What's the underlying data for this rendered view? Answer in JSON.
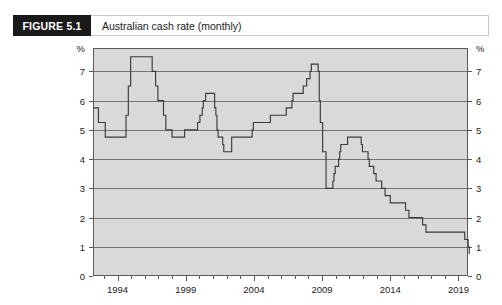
{
  "figure": {
    "number_label": "FIGURE 5.1",
    "title": "Australian cash rate (monthly)"
  },
  "colors": {
    "header_box": "#1a1a1a",
    "header_text": "#ffffff",
    "plot_background": "#d9d9d9",
    "plot_border": "#5a5a5a",
    "gridline": "#6b6b6b",
    "series_line": "#3b3b3b",
    "page_background": "#ffffff"
  },
  "chart_data": {
    "type": "line",
    "title": "Australian cash rate (monthly)",
    "xlabel": "",
    "ylabel": "%",
    "y_unit_label": "%",
    "y_unit_label_right": "%",
    "xlim": [
      1992.2,
      2019.7
    ],
    "ylim": [
      0,
      7.8
    ],
    "yticks": [
      0,
      1,
      2,
      3,
      4,
      5,
      6,
      7
    ],
    "ytick_labels": [
      "0",
      "1",
      "2",
      "3",
      "4",
      "5",
      "6",
      "7"
    ],
    "ytick_labels_right": [
      "0",
      "1",
      "2",
      "3",
      "4",
      "5",
      "6",
      "7"
    ],
    "xticks_major": [
      1994,
      1999,
      2004,
      2009,
      2014,
      2019
    ],
    "xtick_labels": [
      "1994",
      "1999",
      "2004",
      "2009",
      "2014",
      "2019"
    ],
    "xticks_minor_start": 1993,
    "xticks_minor_end": 2019,
    "xticks_minor_step": 1,
    "grid": true,
    "grid_axis": "y",
    "legend": null,
    "step_style": "post",
    "series": [
      {
        "name": "Australian cash rate",
        "x": [
          1992.25,
          1992.6,
          1993.1,
          1993.6,
          1994.62,
          1994.79,
          1994.96,
          1995.2,
          1996.54,
          1996.79,
          1996.96,
          1997.37,
          1997.54,
          1997.79,
          1998.0,
          1998.92,
          1999.87,
          2000.04,
          2000.21,
          2000.29,
          2000.46,
          2000.62,
          2001.12,
          2001.21,
          2001.29,
          2001.37,
          2001.71,
          2001.79,
          2002.37,
          2002.54,
          2003.87,
          2003.96,
          2005.21,
          2006.37,
          2006.79,
          2006.87,
          2007.62,
          2007.87,
          2008.12,
          2008.21,
          2008.71,
          2008.79,
          2008.87,
          2009.04,
          2009.29,
          2009.79,
          2009.87,
          2009.96,
          2010.21,
          2010.29,
          2010.37,
          2010.87,
          2011.87,
          2011.96,
          2012.37,
          2012.46,
          2012.79,
          2012.96,
          2013.37,
          2013.62,
          2014.0,
          2015.12,
          2015.37,
          2016.37,
          2016.62,
          2019.46,
          2019.71,
          2019.79
        ],
        "y": [
          5.75,
          5.25,
          4.75,
          4.75,
          5.5,
          6.5,
          7.5,
          7.5,
          7.0,
          6.5,
          6.0,
          5.5,
          5.0,
          5.0,
          4.75,
          5.0,
          5.25,
          5.5,
          5.75,
          6.0,
          6.25,
          6.25,
          5.75,
          5.5,
          5.0,
          4.75,
          4.5,
          4.25,
          4.75,
          4.75,
          5.0,
          5.25,
          5.5,
          5.75,
          6.0,
          6.25,
          6.5,
          6.75,
          7.0,
          7.25,
          7.0,
          6.0,
          5.25,
          4.25,
          3.0,
          3.25,
          3.5,
          3.75,
          4.0,
          4.25,
          4.5,
          4.75,
          4.5,
          4.25,
          4.0,
          3.75,
          3.5,
          3.25,
          3.0,
          2.75,
          2.5,
          2.25,
          2.0,
          1.75,
          1.5,
          1.25,
          1.0,
          0.75
        ]
      }
    ],
    "notable_points": {
      "peak_1995": 7.5,
      "trough_1993": 4.75,
      "peak_2000": 6.25,
      "trough_2001": 4.25,
      "peak_2008": 7.25,
      "gfc_trough_2009": 3.0,
      "peak_2010_2011": 4.75,
      "final_2019": 0.75
    }
  }
}
